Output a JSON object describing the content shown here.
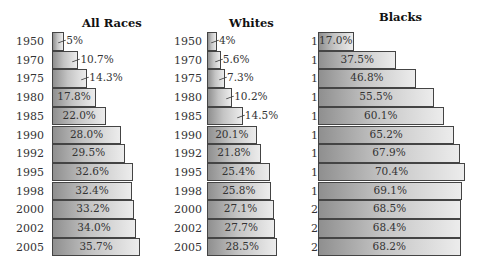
{
  "chart_data": [
    {
      "type": "bar",
      "orientation": "horizontal",
      "title": "All Races",
      "categories": [
        "1950",
        "1970",
        "1975",
        "1980",
        "1985",
        "1990",
        "1992",
        "1995",
        "1998",
        "2000",
        "2002",
        "2005"
      ],
      "values": [
        5,
        10.7,
        14.3,
        17.8,
        22.0,
        28.0,
        29.5,
        32.6,
        32.4,
        33.2,
        34.0,
        35.7
      ],
      "labels": [
        "5%",
        "10.7%",
        "14.3%",
        "17.8%",
        "22.0%",
        "28.0%",
        "29.5%",
        "32.6%",
        "32.4%",
        "33.2%",
        "34.0%",
        "35.7%"
      ],
      "xlabel": "",
      "ylabel": "",
      "grid": false
    },
    {
      "type": "bar",
      "orientation": "horizontal",
      "title": "Whites",
      "categories": [
        "1950",
        "1970",
        "1975",
        "1980",
        "1985",
        "1990",
        "1992",
        "1995",
        "1998",
        "2000",
        "2002",
        "2005"
      ],
      "values": [
        4,
        5.6,
        7.3,
        10.2,
        14.5,
        20.1,
        21.8,
        25.4,
        25.8,
        27.1,
        27.7,
        28.5
      ],
      "labels": [
        "4%",
        "5.6%",
        "7.3%",
        "10.2%",
        "14.5%",
        "20.1%",
        "21.8%",
        "25.4%",
        "25.8%",
        "27.1%",
        "27.7%",
        "28.5%"
      ],
      "xlabel": "",
      "ylabel": "",
      "grid": false
    },
    {
      "type": "bar",
      "orientation": "horizontal",
      "title": "Blacks",
      "categories": [
        "1950",
        "1970",
        "1975",
        "1980",
        "1985",
        "1990",
        "1992",
        "1995",
        "1998",
        "2000",
        "2002",
        "2005"
      ],
      "values": [
        17.0,
        37.5,
        46.8,
        55.5,
        60.1,
        65.2,
        67.9,
        70.4,
        69.1,
        68.5,
        68.4,
        68.2
      ],
      "labels": [
        "17.0%",
        "37.5%",
        "46.8%",
        "55.5%",
        "60.1%",
        "65.2%",
        "67.9%",
        "70.4%",
        "69.1%",
        "68.5%",
        "68.4%",
        "68.2%"
      ],
      "xlabel": "",
      "ylabel": "",
      "grid": false
    }
  ],
  "panels": [
    {
      "title": "All Races"
    },
    {
      "title": "Whites"
    },
    {
      "title": "Blacks"
    }
  ]
}
